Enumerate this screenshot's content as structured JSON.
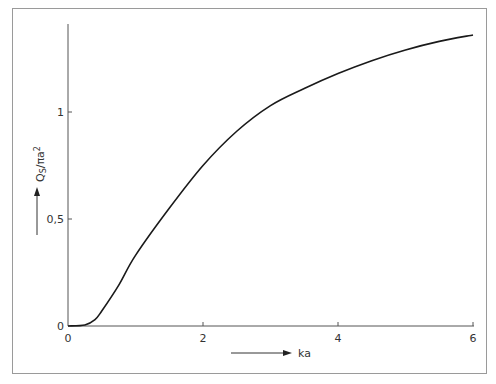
{
  "chart_data": {
    "type": "line",
    "title": "",
    "xlabel": "ka",
    "ylabel": "Q_S/πa²",
    "ylabel_main": "Q",
    "ylabel_sub": "S",
    "ylabel_rest": "/πa",
    "ylabel_sup": "2",
    "xlim": [
      0,
      6
    ],
    "ylim": [
      0,
      1.4
    ],
    "x_ticks": [
      0,
      2,
      4,
      6
    ],
    "x_tick_labels": [
      "0",
      "2",
      "4",
      "6"
    ],
    "y_ticks": [
      0,
      0.5,
      1
    ],
    "y_tick_labels": [
      "0",
      "0,5",
      "1"
    ],
    "grid": false,
    "legend": null,
    "series": [
      {
        "name": "Q_S/πa²",
        "color": "#1a1a1a",
        "x": [
          0,
          0.25,
          0.4,
          0.5,
          0.75,
          1.0,
          1.5,
          2.0,
          2.5,
          3.0,
          3.5,
          4.0,
          4.5,
          5.0,
          5.5,
          6.0
        ],
        "values": [
          0,
          0.005,
          0.03,
          0.07,
          0.19,
          0.33,
          0.55,
          0.75,
          0.91,
          1.03,
          1.11,
          1.18,
          1.24,
          1.29,
          1.33,
          1.36
        ]
      }
    ]
  }
}
